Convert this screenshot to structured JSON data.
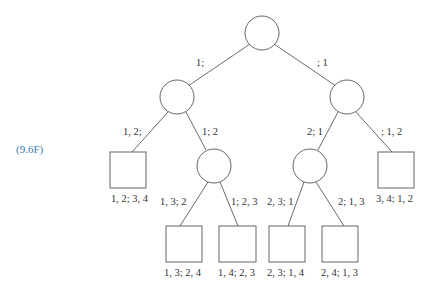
{
  "equation_label": "(9.6F)",
  "edges": {
    "root_left": "1;",
    "root_right": "; 1",
    "l_ll": "1, 2;",
    "l_lr": "1; 2",
    "r_rl": "2; 1",
    "r_rr": "; 1, 2",
    "lr_a": "1, 3; 2",
    "lr_b": "1; 2, 3",
    "rl_a": "2, 3; 1",
    "rl_b": "2; 1, 3"
  },
  "leaves": {
    "l1": "1, 2; 3, 4",
    "l2": "3, 4; 1, 2",
    "b1": "1, 3; 2, 4",
    "b2": "1, 4; 2, 3",
    "b3": "2, 3; 1, 4",
    "b4": "2, 4; 1, 3"
  },
  "colors": {
    "equation": "#3a7ab0",
    "line": "#444444"
  }
}
